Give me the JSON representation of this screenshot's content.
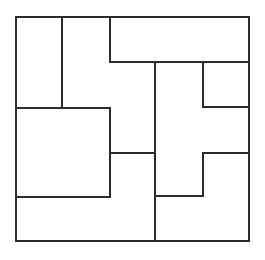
{
  "figure": {
    "background_color": "#ffffff",
    "line_color": "#2b2b2b",
    "line_width": 2,
    "canvas": {
      "width": 265,
      "height": 260
    },
    "frame": {
      "x": 16,
      "y": 17,
      "width": 233,
      "height": 224
    },
    "segments": [
      {
        "name": "frame-top",
        "orientation": "horizontal",
        "x1": 16,
        "y1": 17,
        "x2": 249,
        "y2": 17
      },
      {
        "name": "frame-right",
        "orientation": "vertical",
        "x1": 249,
        "y1": 17,
        "x2": 249,
        "y2": 241
      },
      {
        "name": "frame-bottom",
        "orientation": "horizontal",
        "x1": 16,
        "y1": 241,
        "x2": 249,
        "y2": 241
      },
      {
        "name": "frame-left",
        "orientation": "vertical",
        "x1": 16,
        "y1": 17,
        "x2": 16,
        "y2": 241
      },
      {
        "name": "divider-v-62",
        "orientation": "vertical",
        "x1": 62,
        "y1": 17,
        "x2": 62,
        "y2": 108
      },
      {
        "name": "divider-v-110-top",
        "orientation": "vertical",
        "x1": 110,
        "y1": 17,
        "x2": 110,
        "y2": 62
      },
      {
        "name": "divider-h-62",
        "orientation": "horizontal",
        "x1": 110,
        "y1": 62,
        "x2": 249,
        "y2": 62
      },
      {
        "name": "divider-v-155",
        "orientation": "vertical",
        "x1": 155,
        "y1": 62,
        "x2": 155,
        "y2": 241
      },
      {
        "name": "divider-v-203-up",
        "orientation": "vertical",
        "x1": 203,
        "y1": 62,
        "x2": 203,
        "y2": 107
      },
      {
        "name": "divider-h-107",
        "orientation": "horizontal",
        "x1": 203,
        "y1": 107,
        "x2": 249,
        "y2": 107
      },
      {
        "name": "divider-h-108",
        "orientation": "horizontal",
        "x1": 16,
        "y1": 108,
        "x2": 110,
        "y2": 108
      },
      {
        "name": "divider-v-110-mid",
        "orientation": "vertical",
        "x1": 110,
        "y1": 108,
        "x2": 110,
        "y2": 197
      },
      {
        "name": "divider-h-153-mid",
        "orientation": "horizontal",
        "x1": 110,
        "y1": 153,
        "x2": 155,
        "y2": 153
      },
      {
        "name": "divider-h-153-rt",
        "orientation": "horizontal",
        "x1": 203,
        "y1": 153,
        "x2": 249,
        "y2": 153
      },
      {
        "name": "divider-v-203-low",
        "orientation": "vertical",
        "x1": 203,
        "y1": 153,
        "x2": 203,
        "y2": 196
      },
      {
        "name": "divider-h-196",
        "orientation": "horizontal",
        "x1": 155,
        "y1": 196,
        "x2": 203,
        "y2": 196
      },
      {
        "name": "divider-h-197",
        "orientation": "horizontal",
        "x1": 16,
        "y1": 197,
        "x2": 110,
        "y2": 197
      }
    ],
    "regions": [
      {
        "name": "region-top-left",
        "shape": "rect",
        "x": 16,
        "y": 17,
        "width": 46,
        "height": 91
      },
      {
        "name": "region-top-second",
        "shape": "rect",
        "x": 62,
        "y": 17,
        "width": 48,
        "height": 136
      },
      {
        "name": "region-top-banner",
        "shape": "rect",
        "x": 110,
        "y": 17,
        "width": 139,
        "height": 45
      },
      {
        "name": "region-mid-left-large",
        "shape": "rect",
        "x": 16,
        "y": 108,
        "width": 94,
        "height": 89
      },
      {
        "name": "region-center-column",
        "shape": "rect",
        "x": 155,
        "y": 62,
        "width": 48,
        "height": 134
      },
      {
        "name": "region-right-small",
        "shape": "rect",
        "x": 203,
        "y": 62,
        "width": 46,
        "height": 45
      },
      {
        "name": "region-right-tall",
        "shape": "rect",
        "x": 203,
        "y": 107,
        "width": 46,
        "height": 46
      },
      {
        "name": "region-mid-lower",
        "shape": "rect",
        "x": 110,
        "y": 153,
        "width": 45,
        "height": 88
      },
      {
        "name": "region-bottom-left",
        "shape": "rect",
        "x": 16,
        "y": 197,
        "width": 94,
        "height": 44
      },
      {
        "name": "region-bottom-right",
        "shape": "rect",
        "x": 155,
        "y": 196,
        "width": 94,
        "height": 45
      },
      {
        "name": "region-right-lower-step",
        "shape": "rect",
        "x": 203,
        "y": 153,
        "width": 46,
        "height": 43
      }
    ]
  }
}
